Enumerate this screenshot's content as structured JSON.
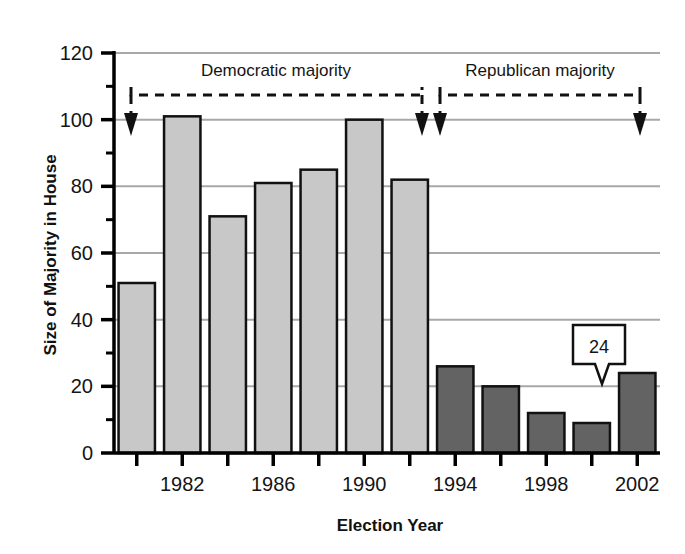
{
  "chart_data": {
    "type": "bar",
    "title": "",
    "xlabel": "Election Year",
    "ylabel": "Size of Majority in House",
    "categories": [
      1980,
      1982,
      1984,
      1986,
      1988,
      1990,
      1992,
      1994,
      1996,
      1998,
      2000,
      2002
    ],
    "values": [
      51,
      101,
      71,
      81,
      85,
      100,
      82,
      26,
      20,
      12,
      9,
      24
    ],
    "series": [
      {
        "name": "Democratic majority",
        "color": "#c8c8c8",
        "x": [
          1980,
          1982,
          1984,
          1986,
          1988,
          1990,
          1992
        ],
        "values": [
          51,
          101,
          71,
          81,
          85,
          100,
          82
        ]
      },
      {
        "name": "Republican majority",
        "color": "#636363",
        "x": [
          1994,
          1996,
          1998,
          2000,
          2002
        ],
        "values": [
          26,
          20,
          12,
          9,
          24
        ]
      }
    ],
    "ylim": [
      0,
      120
    ],
    "ytick_labels": [
      "0",
      "20",
      "40",
      "60",
      "80",
      "100",
      "120"
    ],
    "ytick_values": [
      0,
      20,
      40,
      60,
      80,
      100,
      120
    ],
    "xlim": [
      1979,
      2003
    ],
    "xtick_values": [
      1980,
      1982,
      1984,
      1986,
      1988,
      1990,
      1992,
      1994,
      1996,
      1998,
      2000,
      2002
    ],
    "xtick_labels": [
      "",
      "1982",
      "",
      "1986",
      "",
      "1990",
      "",
      "1994",
      "",
      "1998",
      "",
      "2002"
    ],
    "grid": "horizontal",
    "legend_position": "none",
    "data_labels": [
      {
        "category": 2002,
        "value": 24,
        "text": "24"
      }
    ]
  },
  "annotations": {
    "democratic": {
      "label": "Democratic majority",
      "span_start_year": 1980,
      "span_end_year": 1992,
      "bracket_level": 110
    },
    "republican": {
      "label": "Republican majority",
      "span_start_year": 1994,
      "span_end_year": 2002,
      "bracket_level": 110
    }
  },
  "callout": {
    "value_text": "24"
  },
  "colors": {
    "democratic_bar": "#c8c8c8",
    "republican_bar": "#636363",
    "bar_edge": "#111111",
    "gridline": "#a8a8a8",
    "axis": "#000000",
    "background": "#ffffff"
  }
}
